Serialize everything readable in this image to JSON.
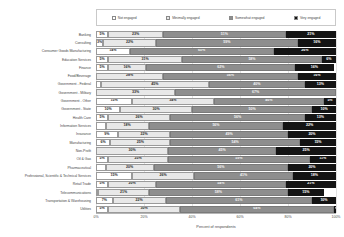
{
  "chart_data": {
    "type": "bar",
    "subtype": "stacked-horizontal-100",
    "title": "",
    "xlabel": "Percent of respondents",
    "ylabel": "",
    "xlim": [
      0,
      100
    ],
    "xticks": [
      "0%",
      "20%",
      "40%",
      "60%",
      "80%",
      "100%"
    ],
    "grid": true,
    "legend_position": "top",
    "series": [
      {
        "name": "Not engaged",
        "color": "#ffffff",
        "values": [
          5,
          3,
          14,
          5,
          5,
          0,
          2,
          0,
          15,
          10,
          5,
          4,
          9,
          6,
          0,
          5,
          4,
          15,
          5,
          1,
          7,
          5
        ]
      },
      {
        "name": "Minimally engaged",
        "color": "#e8e8e8",
        "values": [
          23,
          22,
          0,
          31,
          16,
          28,
          45,
          33,
          34,
          30,
          26,
          18,
          22,
          25,
          30,
          25,
          20,
          26,
          20,
          21,
          22,
          30
        ]
      },
      {
        "name": "Somewhat engaged",
        "color": "#8e8e8e",
        "values": [
          51,
          59,
          60,
          58,
          62,
          56,
          40,
          67,
          46,
          50,
          56,
          56,
          49,
          54,
          45,
          59,
          56,
          41,
          54,
          58,
          61,
          64
        ]
      },
      {
        "name": "Very engaged",
        "color": "#141414",
        "values": [
          21,
          16,
          26,
          6,
          16,
          16,
          13,
          0,
          5,
          10,
          13,
          22,
          20,
          15,
          25,
          11,
          20,
          18,
          21,
          15,
          10,
          1
        ]
      }
    ],
    "categories": [
      "Banking",
      "Consulting",
      "Consumer Goods Manufacturing",
      "Education Services",
      "Finance",
      "Food/Beverage",
      "Government - Federal",
      "Government - Military",
      "Government - Other",
      "Government - State",
      "Health Care",
      "Information Services",
      "Insurance",
      "Manufacturing",
      "Non-Profit",
      "Oil & Gas",
      "Pharmaceutical",
      "Professional, Scientific & Technical Services",
      "Retail Trade",
      "Telecommunications",
      "Transportation & Warehousing",
      "Utilities"
    ],
    "rows": [
      {
        "category": "Banking",
        "segments": [
          {
            "value": 5,
            "label": "5%"
          },
          {
            "value": 23,
            "label": "23%"
          },
          {
            "value": 51,
            "label": "51%"
          },
          {
            "value": 21,
            "label": "21%"
          }
        ]
      },
      {
        "category": "Consulting",
        "segments": [
          {
            "value": 3,
            "label": "3%"
          },
          {
            "value": 22,
            "label": "22%"
          },
          {
            "value": 59,
            "label": "59%"
          },
          {
            "value": 16,
            "label": "16%"
          }
        ]
      },
      {
        "category": "Consumer Goods Manufacturing",
        "segments": [
          {
            "value": 14,
            "label": "14%"
          },
          {
            "value": 0,
            "label": ""
          },
          {
            "value": 60,
            "label": "60%"
          },
          {
            "value": 26,
            "label": "26%"
          }
        ]
      },
      {
        "category": "Education Services",
        "segments": [
          {
            "value": 5,
            "label": "5%"
          },
          {
            "value": 31,
            "label": "31%"
          },
          {
            "value": 58,
            "label": "58%"
          },
          {
            "value": 6,
            "label": "6%"
          }
        ]
      },
      {
        "category": "Finance",
        "segments": [
          {
            "value": 5,
            "label": "5%"
          },
          {
            "value": 16,
            "label": "16%"
          },
          {
            "value": 62,
            "label": "62%"
          },
          {
            "value": 16,
            "label": "16%"
          }
        ]
      },
      {
        "category": "Food/Beverage",
        "segments": [
          {
            "value": 0,
            "label": ""
          },
          {
            "value": 28,
            "label": "28%"
          },
          {
            "value": 56,
            "label": "56%"
          },
          {
            "value": 16,
            "label": "16%"
          }
        ]
      },
      {
        "category": "Government - Federal",
        "segments": [
          {
            "value": 2,
            "label": ""
          },
          {
            "value": 45,
            "label": "45%"
          },
          {
            "value": 40,
            "label": "40%"
          },
          {
            "value": 13,
            "label": "13%"
          }
        ]
      },
      {
        "category": "Government - Military",
        "segments": [
          {
            "value": 0,
            "label": ""
          },
          {
            "value": 33,
            "label": "33%"
          },
          {
            "value": 67,
            "label": "67%"
          },
          {
            "value": 0,
            "label": ""
          }
        ]
      },
      {
        "category": "Government - Other",
        "segments": [
          {
            "value": 15,
            "label": "15%"
          },
          {
            "value": 34,
            "label": "34%"
          },
          {
            "value": 46,
            "label": "46%"
          },
          {
            "value": 5,
            "label": "5%"
          }
        ]
      },
      {
        "category": "Government - State",
        "segments": [
          {
            "value": 10,
            "label": "10%"
          },
          {
            "value": 30,
            "label": "30%"
          },
          {
            "value": 50,
            "label": "50%"
          },
          {
            "value": 10,
            "label": "10%"
          }
        ]
      },
      {
        "category": "Health Care",
        "segments": [
          {
            "value": 5,
            "label": "5%"
          },
          {
            "value": 26,
            "label": "26%"
          },
          {
            "value": 56,
            "label": "56%"
          },
          {
            "value": 13,
            "label": "13%"
          }
        ]
      },
      {
        "category": "Information Services",
        "segments": [
          {
            "value": 4,
            "label": ""
          },
          {
            "value": 18,
            "label": "18%"
          },
          {
            "value": 56,
            "label": "56%"
          },
          {
            "value": 22,
            "label": "22%"
          }
        ]
      },
      {
        "category": "Insurance",
        "segments": [
          {
            "value": 9,
            "label": "9%"
          },
          {
            "value": 22,
            "label": "22%"
          },
          {
            "value": 49,
            "label": "49%"
          },
          {
            "value": 20,
            "label": "20%"
          }
        ]
      },
      {
        "category": "Manufacturing",
        "segments": [
          {
            "value": 6,
            "label": "6%"
          },
          {
            "value": 25,
            "label": "25%"
          },
          {
            "value": 54,
            "label": "54%"
          },
          {
            "value": 15,
            "label": "15%"
          }
        ]
      },
      {
        "category": "Non-Profit",
        "segments": [
          {
            "value": 0,
            "label": ""
          },
          {
            "value": 30,
            "label": "30%"
          },
          {
            "value": 45,
            "label": "45%"
          },
          {
            "value": 25,
            "label": "25%"
          }
        ]
      },
      {
        "category": "Oil & Gas",
        "segments": [
          {
            "value": 5,
            "label": "5%"
          },
          {
            "value": 25,
            "label": "25%"
          },
          {
            "value": 59,
            "label": "59%"
          },
          {
            "value": 11,
            "label": "11%"
          }
        ]
      },
      {
        "category": "Pharmaceutical",
        "segments": [
          {
            "value": 4,
            "label": ""
          },
          {
            "value": 20,
            "label": "20%"
          },
          {
            "value": 56,
            "label": "56%"
          },
          {
            "value": 20,
            "label": "20%"
          }
        ]
      },
      {
        "category": "Professional, Scientific & Technical Services",
        "segments": [
          {
            "value": 15,
            "label": "15%"
          },
          {
            "value": 26,
            "label": "26%"
          },
          {
            "value": 41,
            "label": "41%"
          },
          {
            "value": 18,
            "label": "18%"
          }
        ]
      },
      {
        "category": "Retail Trade",
        "segments": [
          {
            "value": 5,
            "label": "5%"
          },
          {
            "value": 20,
            "label": "20%"
          },
          {
            "value": 54,
            "label": "54%"
          },
          {
            "value": 21,
            "label": "21%"
          }
        ]
      },
      {
        "category": "Telecommunications",
        "segments": [
          {
            "value": 1,
            "label": ""
          },
          {
            "value": 21,
            "label": "21%"
          },
          {
            "value": 58,
            "label": "58%"
          },
          {
            "value": 15,
            "label": "15%"
          }
        ]
      },
      {
        "category": "Transportation & Warehousing",
        "segments": [
          {
            "value": 7,
            "label": "7%"
          },
          {
            "value": 22,
            "label": "22%"
          },
          {
            "value": 61,
            "label": "61%"
          },
          {
            "value": 10,
            "label": "10%"
          }
        ]
      },
      {
        "category": "Utilities",
        "segments": [
          {
            "value": 5,
            "label": "5%"
          },
          {
            "value": 30,
            "label": "30%"
          },
          {
            "value": 64,
            "label": "64%"
          },
          {
            "value": 1,
            "label": "1%"
          }
        ]
      }
    ]
  },
  "legend": {
    "items": [
      {
        "label": "Not engaged",
        "color": "#ffffff"
      },
      {
        "label": "Minimally engaged",
        "color": "#e8e8e8"
      },
      {
        "label": "Somewhat engaged",
        "color": "#8e8e8e"
      },
      {
        "label": "Very engaged",
        "color": "#141414"
      }
    ]
  },
  "axis": {
    "title": "Percent of respondents",
    "ticks": [
      "0%",
      "20%",
      "40%",
      "60%",
      "80%",
      "100%"
    ]
  }
}
